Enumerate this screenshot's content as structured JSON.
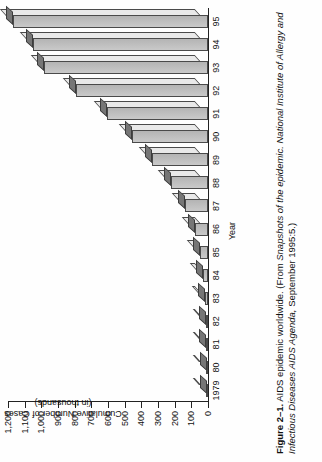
{
  "figure": {
    "number": "Figure 2–1.",
    "title_text": " AIDS epidemic worldwide. ",
    "source_open": "(From ",
    "source_italic": "Snapshots of the epidemic. National Institute of Allergy and Infectious Diseases AIDS Agenda,",
    "source_close": " September 1995:5.)"
  },
  "chart_data": {
    "type": "bar",
    "orientation": "horizontal-rotated",
    "title": "AIDS epidemic worldwide",
    "xlabel": "Year",
    "ylabel": "Cumulative Number of Cases (in thousands)",
    "ylabel_line1": "Cumulative Number of Cases",
    "ylabel_line2": "(in thousands)",
    "categories": [
      "1979",
      "80",
      "81",
      "82",
      "83",
      "84",
      "85",
      "86",
      "87",
      "88",
      "89",
      "90",
      "91",
      "92",
      "93",
      "94",
      "95"
    ],
    "values": [
      0,
      5,
      10,
      15,
      20,
      30,
      50,
      80,
      140,
      230,
      350,
      470,
      630,
      820,
      1020,
      1090,
      1210
    ],
    "ylim": [
      0,
      1200
    ],
    "ytick_values": [
      0,
      100,
      200,
      300,
      400,
      500,
      600,
      700,
      800,
      900,
      1000,
      1100,
      1200
    ],
    "ytick_labels": [
      "0",
      "100",
      "200",
      "300",
      "400",
      "500",
      "600",
      "700",
      "800",
      "900",
      "1,000",
      "1,100",
      "1,200"
    ],
    "grid": false,
    "legend": false,
    "bar_top_color": "#767676",
    "bar_front_color": "#bfbfbf",
    "bar_side_color": "#e9e9e9",
    "bar_edge_color": "#4a4a4a"
  }
}
